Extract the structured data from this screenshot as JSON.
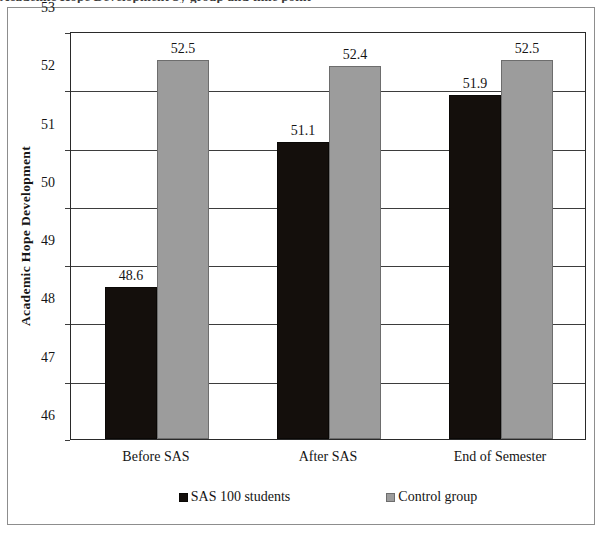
{
  "figure": {
    "clipped_caption_above": "Academic Hope Development by group and time point"
  },
  "chart_data": {
    "type": "bar",
    "title": "",
    "xlabel": "",
    "ylabel": "Academic Hope Development",
    "ylim": [
      46,
      53
    ],
    "ytick_step": 1,
    "yticks": [
      "53",
      "52",
      "51",
      "50",
      "49",
      "48",
      "47",
      "46"
    ],
    "grid": true,
    "legend_position": "bottom",
    "categories": [
      "Before SAS",
      "After SAS",
      "End of Semester"
    ],
    "series": [
      {
        "name": "SAS 100 students",
        "color": "#140f0c",
        "values": [
          48.6,
          51.1,
          51.9
        ],
        "labels": [
          "48.6",
          "51.1",
          "51.9"
        ]
      },
      {
        "name": "Control group",
        "color": "#9c9c9c",
        "values": [
          52.5,
          52.4,
          52.5
        ],
        "labels": [
          "52.5",
          "52.4",
          "52.5"
        ]
      }
    ]
  }
}
